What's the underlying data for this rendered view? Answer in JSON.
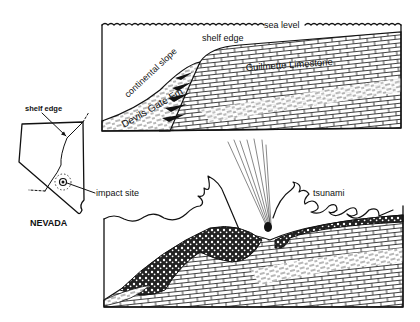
{
  "figure": {
    "top_panel": {
      "labels": {
        "sea_level": "sea level",
        "shelf_edge": "shelf edge",
        "continental_slope": "continental slope",
        "guilmette": "Guilmette Limestone",
        "devils_gate": "Devils Gate Fm"
      }
    },
    "map_panel": {
      "labels": {
        "shelf_edge": "shelf edge",
        "impact_site": "impact site",
        "state": "NEVADA"
      }
    },
    "bottom_panel": {
      "labels": {
        "tsunami": "tsunami"
      }
    },
    "icons": [
      "bolide-icon",
      "impact-site-marker-icon"
    ],
    "colors": {
      "ink": "#111111",
      "paper": "#ffffff"
    }
  }
}
